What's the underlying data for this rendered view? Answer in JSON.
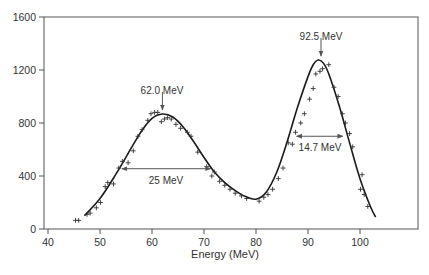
{
  "chart_data": {
    "type": "line",
    "title": "",
    "xlabel": "Energy (MeV)",
    "ylabel": "",
    "xlim": [
      40,
      110
    ],
    "ylim": [
      0,
      1600
    ],
    "x_ticks": [
      40,
      50,
      60,
      70,
      80,
      90,
      100
    ],
    "y_ticks": [
      0,
      400,
      800,
      1200,
      1600
    ],
    "grid": false,
    "legend": null,
    "series": [
      {
        "name": "fit",
        "style": "solid line",
        "x": [
          47,
          50,
          53,
          56,
          58,
          60,
          62,
          64,
          66,
          68,
          70,
          72,
          74,
          76,
          78,
          80,
          82,
          84,
          86,
          88,
          90,
          91,
          92,
          93,
          94,
          96,
          98,
          100,
          102,
          103
        ],
        "y": [
          100,
          230,
          410,
          610,
          740,
          835,
          868,
          845,
          770,
          660,
          540,
          430,
          350,
          290,
          245,
          225,
          280,
          430,
          660,
          920,
          1150,
          1240,
          1275,
          1250,
          1170,
          930,
          650,
          380,
          170,
          90
        ]
      },
      {
        "name": "data",
        "style": "plus markers",
        "x": [
          45.3,
          45.9,
          47.5,
          48.1,
          49.3,
          50.1,
          51.0,
          51.5,
          52.6,
          53.6,
          54.3,
          55.4,
          56.4,
          57.3,
          58.1,
          59.2,
          59.8,
          60.5,
          61.1,
          61.8,
          62.4,
          63.0,
          63.7,
          64.6,
          65.5,
          66.8,
          67.5,
          68.8,
          70.5,
          71.5,
          72.0,
          73.0,
          74.0,
          75.0,
          76.0,
          77.2,
          78.2,
          80.6,
          81.5,
          82.3,
          83.2,
          84.3,
          85.2,
          86.2,
          87.0,
          87.6,
          88.6,
          89.3,
          90.3,
          91.0,
          91.5,
          92.3,
          92.8,
          94.0,
          95.0,
          95.8,
          96.6,
          97.2,
          98.0,
          98.6,
          100.4,
          100.1,
          100.8,
          101.5
        ],
        "y": [
          65,
          65,
          110,
          120,
          160,
          200,
          320,
          350,
          340,
          460,
          510,
          500,
          590,
          700,
          750,
          820,
          870,
          880,
          880,
          810,
          830,
          840,
          830,
          790,
          760,
          730,
          700,
          580,
          470,
          400,
          430,
          360,
          330,
          300,
          270,
          250,
          230,
          210,
          240,
          260,
          300,
          380,
          460,
          650,
          640,
          730,
          800,
          870,
          980,
          1060,
          1170,
          1190,
          1210,
          1240,
          1070,
          1000,
          870,
          800,
          720,
          620,
          410,
          300,
          260,
          170
        ]
      }
    ],
    "annotations": [
      {
        "text": "62.0 MeV",
        "type": "peak-arrow",
        "x": 62.0,
        "y": 868
      },
      {
        "text": "92.5 MeV",
        "type": "peak-arrow",
        "x": 92.5,
        "y": 1275
      },
      {
        "text": "25 MeV",
        "type": "width-arrow",
        "x_start": 54.2,
        "x_end": 71.3,
        "y": 455
      },
      {
        "text": "14.7 MeV",
        "type": "width-arrow",
        "x_start": 87.8,
        "x_end": 96.7,
        "y": 700
      }
    ]
  },
  "axis": {
    "x_label": "Energy (MeV)",
    "x_tick_labels": [
      "40",
      "50",
      "60",
      "70",
      "80",
      "90",
      "100"
    ],
    "y_tick_labels": [
      "0",
      "400",
      "800",
      "1200",
      "1600"
    ]
  },
  "labels": {
    "peak1": "62.0 MeV",
    "peak2": "92.5 MeV",
    "width1": "25 MeV",
    "width2": "14.7 MeV"
  },
  "colors": {
    "axis": "#555555",
    "curve": "#1a1a1a",
    "marker": "#333333",
    "text": "#333333"
  }
}
